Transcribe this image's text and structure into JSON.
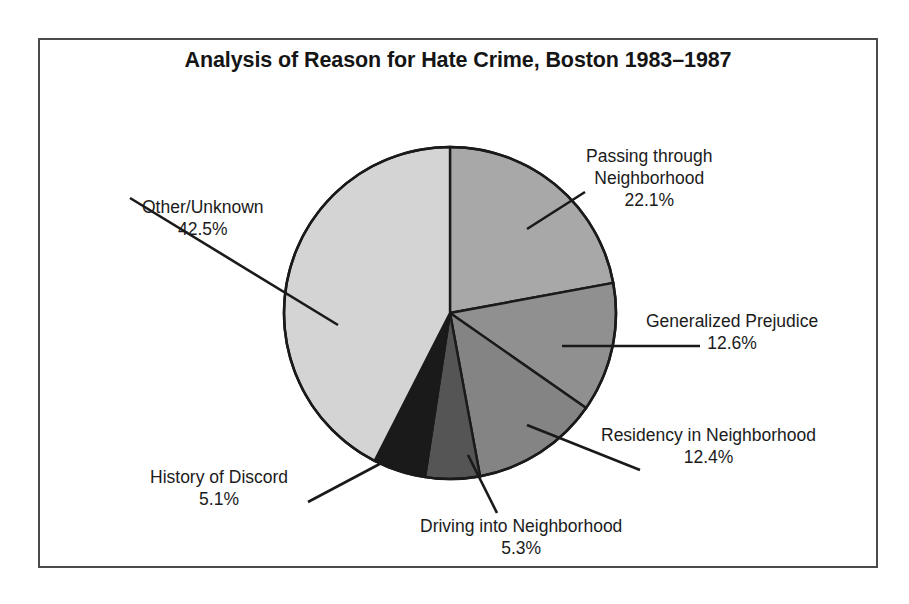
{
  "chart_data": {
    "type": "pie",
    "title": "Analysis of Reason for Hate Crime, Boston 1983–1987",
    "xlabel": "",
    "ylabel": "",
    "legend": "none",
    "grid": false,
    "units": "percent",
    "start_angle_deg": 0,
    "direction": "clockwise",
    "categories": [
      "Passing through Neighborhood",
      "Generalized Prejudice",
      "Residency in Neighborhood",
      "Driving into Neighborhood",
      "History of Discord",
      "Other/Unknown"
    ],
    "values": [
      22.1,
      12.6,
      12.4,
      5.3,
      5.1,
      42.5
    ],
    "value_labels": [
      "22.1%",
      "12.6%",
      "12.4%",
      "5.3%",
      "5.1%",
      "42.5%"
    ],
    "colors": [
      "#a8a8a8",
      "#909090",
      "#848484",
      "#555555",
      "#1a1a1a",
      "#d4d4d4"
    ],
    "slices": [
      {
        "label_line1": "Passing through",
        "label_line2": "Neighborhood",
        "percent_label": "22.1%",
        "value": 22.1,
        "color": "#a8a8a8"
      },
      {
        "label_line1": "Generalized Prejudice",
        "label_line2": "",
        "percent_label": "12.6%",
        "value": 12.6,
        "color": "#909090"
      },
      {
        "label_line1": "Residency in Neighborhood",
        "label_line2": "",
        "percent_label": "12.4%",
        "value": 12.4,
        "color": "#848484"
      },
      {
        "label_line1": "Driving into Neighborhood",
        "label_line2": "",
        "percent_label": "5.3%",
        "value": 5.3,
        "color": "#555555"
      },
      {
        "label_line1": "History of Discord",
        "label_line2": "",
        "percent_label": "5.1%",
        "value": 5.1,
        "color": "#1a1a1a"
      },
      {
        "label_line1": "Other/Unknown",
        "label_line2": "",
        "percent_label": "42.5%",
        "value": 42.5,
        "color": "#d4d4d4"
      }
    ]
  },
  "figure": {
    "title": "Analysis of Reason for Hate Crime, Boston 1983–1987",
    "border_color": "#4a4a4a",
    "background": "#ffffff",
    "outline_color": "#1a1a1a"
  },
  "callouts": {
    "passing": {
      "line1": "Passing through",
      "line2": "Neighborhood",
      "pct": "22.1%"
    },
    "generalized": {
      "line1": "Generalized Prejudice",
      "pct": "12.6%"
    },
    "residency": {
      "line1": "Residency in Neighborhood",
      "pct": "12.4%"
    },
    "driving": {
      "line1": "Driving into Neighborhood",
      "pct": "5.3%"
    },
    "history": {
      "line1": "History of Discord",
      "pct": "5.1%"
    },
    "other": {
      "line1": "Other/Unknown",
      "pct": "42.5%"
    }
  }
}
